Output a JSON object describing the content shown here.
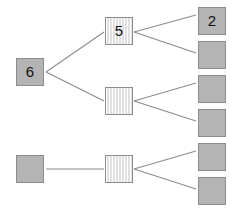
{
  "diagram": {
    "type": "tree-forest",
    "title": "",
    "colors": {
      "node_fill_grey": "#b4b4b4",
      "node_fill_hatch": "#ececec",
      "node_border": "#8c8c8c",
      "edge": "#8c8c8c",
      "background": "#ffffff",
      "label_text": "#111111"
    },
    "nodes": [
      {
        "id": "n-6",
        "label": "6",
        "fill": "grey",
        "x": 16,
        "y": 58,
        "w": 28,
        "h": 28
      },
      {
        "id": "n-5",
        "label": "5",
        "fill": "hatch",
        "x": 105,
        "y": 17,
        "w": 28,
        "h": 28
      },
      {
        "id": "n-h1",
        "label": "",
        "fill": "hatch",
        "x": 105,
        "y": 87,
        "w": 28,
        "h": 28
      },
      {
        "id": "n-2",
        "label": "2",
        "fill": "grey",
        "x": 198,
        "y": 7,
        "w": 28,
        "h": 28
      },
      {
        "id": "n-r2",
        "label": "",
        "fill": "grey",
        "x": 198,
        "y": 41,
        "w": 28,
        "h": 28
      },
      {
        "id": "n-r3",
        "label": "",
        "fill": "grey",
        "x": 198,
        "y": 75,
        "w": 28,
        "h": 28
      },
      {
        "id": "n-r4",
        "label": "",
        "fill": "grey",
        "x": 198,
        "y": 109,
        "w": 28,
        "h": 28
      },
      {
        "id": "n-r5",
        "label": "",
        "fill": "grey",
        "x": 198,
        "y": 143,
        "w": 28,
        "h": 28
      },
      {
        "id": "n-r6",
        "label": "",
        "fill": "grey",
        "x": 198,
        "y": 177,
        "w": 28,
        "h": 28
      },
      {
        "id": "n-b1",
        "label": "",
        "fill": "grey",
        "x": 16,
        "y": 155,
        "w": 28,
        "h": 28
      },
      {
        "id": "n-b2",
        "label": "",
        "fill": "hatch",
        "x": 105,
        "y": 155,
        "w": 28,
        "h": 28
      }
    ],
    "edges": [
      {
        "from": "n-6",
        "to": "n-5",
        "x1": 46,
        "y1": 72,
        "x2": 104,
        "y2": 32
      },
      {
        "from": "n-6",
        "to": "n-h1",
        "x1": 46,
        "y1": 72,
        "x2": 104,
        "y2": 101
      },
      {
        "from": "n-5",
        "to": "n-2",
        "x1": 134,
        "y1": 32,
        "x2": 196,
        "y2": 15
      },
      {
        "from": "n-5",
        "to": "n-r2",
        "x1": 134,
        "y1": 32,
        "x2": 196,
        "y2": 53
      },
      {
        "from": "n-h1",
        "to": "n-r3",
        "x1": 134,
        "y1": 101,
        "x2": 196,
        "y2": 83
      },
      {
        "from": "n-h1",
        "to": "n-r4",
        "x1": 134,
        "y1": 101,
        "x2": 196,
        "y2": 121
      },
      {
        "from": "n-b1",
        "to": "n-b2",
        "x1": 46,
        "y1": 169,
        "x2": 104,
        "y2": 169
      },
      {
        "from": "n-b2",
        "to": "n-r5",
        "x1": 134,
        "y1": 169,
        "x2": 196,
        "y2": 151
      },
      {
        "from": "n-b2",
        "to": "n-r6",
        "x1": 134,
        "y1": 169,
        "x2": 196,
        "y2": 189
      }
    ]
  }
}
